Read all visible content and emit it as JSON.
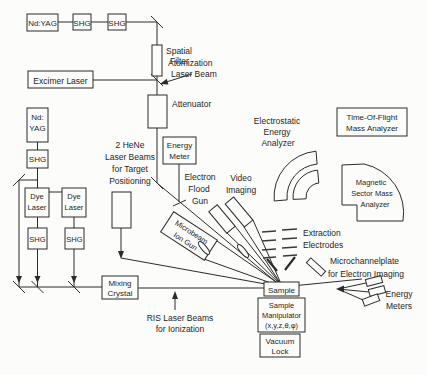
{
  "colors": {
    "ink": "#2b2b2b",
    "background": "#fcfcfa",
    "text": "#1f1f1f"
  },
  "boxes": {
    "nd_yag_top": {
      "label": "Nd:YAG"
    },
    "shg": {
      "label": "SHG"
    },
    "excimer": {
      "label": "Excimer Laser"
    },
    "nd_yag_left": {
      "lines": [
        "Nd:",
        "YAG"
      ]
    },
    "dye_laser": {
      "lines": [
        "Dye",
        "Laser"
      ]
    },
    "energy_meter": {
      "lines": [
        "Energy",
        "Meter"
      ]
    },
    "mixing_crystal": {
      "lines": [
        "Mixing",
        "Crystal"
      ]
    },
    "sample": {
      "label": "Sample"
    },
    "sample_manipulator": {
      "lines": [
        "Sample",
        "Manipulator",
        "(x,y,z,θ,φ)"
      ]
    },
    "vacuum_lock": {
      "lines": [
        "Vacuum",
        "Lock"
      ]
    },
    "tof_analyzer": {
      "lines": [
        "Time-Of-Flight",
        "Mass Analyzer"
      ]
    },
    "microbeam_ion_gun": {
      "lines": [
        "Microbeam",
        "Ion Gun"
      ]
    }
  },
  "labels": {
    "spatial_filter": {
      "lines": [
        "Spatial",
        "Filter"
      ]
    },
    "atomization_beam": {
      "lines": [
        "Atomization",
        "Laser Beam"
      ]
    },
    "attenuator": {
      "label": "Attenuator"
    },
    "hene": {
      "lines": [
        "2 HeNe",
        "Laser Beams",
        "for Target",
        "Positioning"
      ]
    },
    "electron_flood_gun": {
      "lines": [
        "Electron",
        "Flood",
        "Gun"
      ]
    },
    "video_imaging": {
      "lines": [
        "Video",
        "Imaging"
      ]
    },
    "esa": {
      "lines": [
        "Electrostatic",
        "Energy",
        "Analyzer"
      ]
    },
    "magnetic_sector": {
      "lines": [
        "Magnetic",
        "Sector Mass",
        "Analyzer"
      ]
    },
    "extraction_electrodes": {
      "lines": [
        "Extraction",
        "Electrodes"
      ]
    },
    "microchannelplate": {
      "lines": [
        "Microchannelplate",
        "for Electron Imaging"
      ]
    },
    "energy_meters": {
      "lines": [
        "Energy",
        "Meters"
      ]
    },
    "ris": {
      "lines": [
        "RIS Laser Beams",
        "for Ionization"
      ]
    }
  }
}
